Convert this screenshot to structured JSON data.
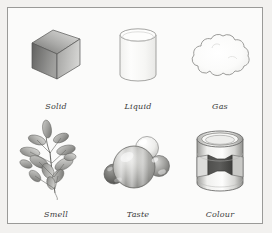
{
  "page": {
    "background_color": "#f2f1ef",
    "panel_color": "#fbfbfa",
    "border_color": "#9a9a98"
  },
  "figure": {
    "rows": [
      {
        "row_index": 0,
        "cells": [
          {
            "caption": "Solid",
            "icon": "cube-icon",
            "subject": "solid state of matter"
          },
          {
            "caption": "Liquid",
            "icon": "beaker-icon",
            "subject": "liquid state of matter"
          },
          {
            "caption": "Gas",
            "icon": "cloud-icon",
            "subject": "gaseous state of matter"
          }
        ]
      },
      {
        "row_index": 1,
        "cells": [
          {
            "caption": "Smell",
            "icon": "plant-sprig-icon",
            "subject": "smell property"
          },
          {
            "caption": "Taste",
            "icon": "molecule-icon",
            "subject": "taste property"
          },
          {
            "caption": "Colour",
            "icon": "paint-can-icon",
            "subject": "colour property"
          }
        ]
      }
    ]
  },
  "palette": {
    "ink": "#3a3a3a",
    "outline": "#7d7d7b",
    "light_gray": "#e9e9e7",
    "mid_gray": "#b9b9b7",
    "dark_gray": "#6e6e6c",
    "near_black": "#4a4a48"
  }
}
